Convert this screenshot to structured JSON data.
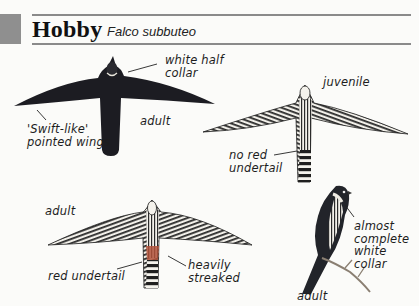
{
  "header": {
    "common_name": "Hobby",
    "scientific_name": "Falco subbuteo"
  },
  "figures": [
    {
      "id": "adult-upperside-flight",
      "plumage": "adult",
      "labels": {
        "age": "adult",
        "collar": "white half\ncollar",
        "wings": "'Swift-like'\npointed wings"
      }
    },
    {
      "id": "juvenile-underside-flight",
      "plumage": "juvenile",
      "labels": {
        "age": "juvenile",
        "undertail": "no red\nundertail"
      }
    },
    {
      "id": "adult-underside-flight",
      "plumage": "adult",
      "labels": {
        "age": "adult",
        "undertail": "red undertail",
        "streaks": "heavily\nstreaked"
      }
    },
    {
      "id": "adult-perched",
      "plumage": "adult",
      "labels": {
        "age": "adult",
        "collar": "almost\ncomplete\nwhite\ncollar"
      }
    }
  ],
  "colors": {
    "marker": "#8f8f8f",
    "rule": "#8a8a8a",
    "dark_plumage": "#1c1c22",
    "undertail_red": "#b0513a",
    "background": "#fbfbf9"
  }
}
